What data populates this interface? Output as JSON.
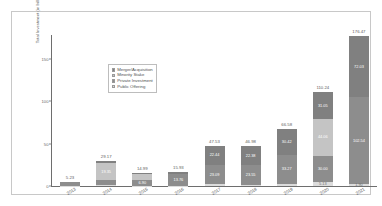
{
  "chart_data": {
    "type": "bar",
    "subtype": "stacked-bar",
    "title": "",
    "xlabel": "",
    "ylabel": "Total Investment (in billions of U.S. Dollars)",
    "categories": [
      "2013",
      "2014",
      "2015",
      "2016",
      "2017",
      "2018",
      "2019",
      "2020",
      "2021"
    ],
    "ylim": [
      0,
      180
    ],
    "yticks": [
      0,
      50,
      100,
      150
    ],
    "ytick_labels": [
      "0",
      "50",
      "100",
      "150"
    ],
    "grid": false,
    "legend_position": "upper left (inside axes)",
    "series": [
      {
        "name": "Merger/Acquisition",
        "color": "#808080",
        "values": [
          0.21,
          2.46,
          1.05,
          1.62,
          22.44,
          22.38,
          30.42,
          31.05,
          72.03
        ]
      },
      {
        "name": "Minority Stake",
        "color": "#c4c4c4",
        "values": [
          0.85,
          19.35,
          6.79,
          0.0,
          0.0,
          0.0,
          0.0,
          44.06,
          0.0
        ]
      },
      {
        "name": "Private Investment",
        "color": "#8d8d8d",
        "values": [
          3.86,
          6.42,
          6.9,
          13.76,
          23.09,
          23.55,
          33.27,
          30.0,
          102.54
        ]
      },
      {
        "name": "Public Offering",
        "color": "#dcdcdc",
        "values": [
          0.31,
          0.94,
          0.25,
          0.55,
          2.0,
          1.05,
          2.89,
          5.13,
          1.9
        ]
      }
    ],
    "stack_order_bottom_to_top": [
      "Public Offering",
      "Private Investment",
      "Minority Stake",
      "Merger/Acquisition"
    ],
    "totals": [
      5.23,
      29.17,
      14.99,
      15.93,
      47.53,
      46.98,
      66.58,
      110.24,
      176.47
    ],
    "total_labels": [
      "5.23",
      "29.17",
      "14.99",
      "15.93",
      "47.53",
      "46.98",
      "66.58",
      "110.24",
      "176.47"
    ],
    "bars": [
      {
        "category": "2013",
        "total_label": "5.23",
        "segments": [
          {
            "series": "Public Offering",
            "value": 0.31,
            "label": ""
          },
          {
            "series": "Private Investment",
            "value": 3.86,
            "label": ""
          },
          {
            "series": "Minority Stake",
            "value": 0.85,
            "label": ""
          },
          {
            "series": "Merger/Acquisition",
            "value": 0.21,
            "label": ""
          }
        ]
      },
      {
        "category": "2014",
        "total_label": "29.17",
        "segments": [
          {
            "series": "Public Offering",
            "value": 0.94,
            "label": ""
          },
          {
            "series": "Private Investment",
            "value": 6.42,
            "label": ""
          },
          {
            "series": "Minority Stake",
            "value": 19.35,
            "label": "19.35"
          },
          {
            "series": "Merger/Acquisition",
            "value": 2.46,
            "label": ""
          }
        ]
      },
      {
        "category": "2015",
        "total_label": "14.99",
        "segments": [
          {
            "series": "Public Offering",
            "value": 0.25,
            "label": ""
          },
          {
            "series": "Private Investment",
            "value": 6.9,
            "label": "6.90"
          },
          {
            "series": "Minority Stake",
            "value": 6.79,
            "label": ""
          },
          {
            "series": "Merger/Acquisition",
            "value": 1.05,
            "label": ""
          }
        ]
      },
      {
        "category": "2016",
        "total_label": "15.93",
        "segments": [
          {
            "series": "Public Offering",
            "value": 0.55,
            "label": ""
          },
          {
            "series": "Private Investment",
            "value": 13.76,
            "label": "13.76"
          },
          {
            "series": "Minority Stake",
            "value": 0.0,
            "label": ""
          },
          {
            "series": "Merger/Acquisition",
            "value": 1.62,
            "label": ""
          }
        ]
      },
      {
        "category": "2017",
        "total_label": "47.53",
        "segments": [
          {
            "series": "Public Offering",
            "value": 2.0,
            "label": ""
          },
          {
            "series": "Private Investment",
            "value": 23.09,
            "label": "23.09"
          },
          {
            "series": "Minority Stake",
            "value": 0.0,
            "label": ""
          },
          {
            "series": "Merger/Acquisition",
            "value": 22.44,
            "label": "22.44"
          }
        ]
      },
      {
        "category": "2018",
        "total_label": "46.98",
        "segments": [
          {
            "series": "Public Offering",
            "value": 1.05,
            "label": ""
          },
          {
            "series": "Private Investment",
            "value": 23.55,
            "label": "23.55"
          },
          {
            "series": "Minority Stake",
            "value": 0.0,
            "label": ""
          },
          {
            "series": "Merger/Acquisition",
            "value": 22.38,
            "label": "22.38"
          }
        ]
      },
      {
        "category": "2019",
        "total_label": "66.58",
        "segments": [
          {
            "series": "Public Offering",
            "value": 2.89,
            "label": ""
          },
          {
            "series": "Private Investment",
            "value": 33.27,
            "label": "33.27"
          },
          {
            "series": "Minority Stake",
            "value": 0.0,
            "label": ""
          },
          {
            "series": "Merger/Acquisition",
            "value": 30.42,
            "label": "30.42"
          }
        ]
      },
      {
        "category": "2020",
        "total_label": "110.24",
        "segments": [
          {
            "series": "Public Offering",
            "value": 5.13,
            "label": "5.13"
          },
          {
            "series": "Private Investment",
            "value": 30.0,
            "label": "30.00"
          },
          {
            "series": "Minority Stake",
            "value": 44.06,
            "label": "44.06"
          },
          {
            "series": "Merger/Acquisition",
            "value": 31.05,
            "label": "31.05"
          }
        ]
      },
      {
        "category": "2021",
        "total_label": "176.47",
        "segments": [
          {
            "series": "Public Offering",
            "value": 1.9,
            "label": "1.90"
          },
          {
            "series": "Private Investment",
            "value": 102.54,
            "label": "102.54"
          },
          {
            "series": "Minority Stake",
            "value": 0.0,
            "label": ""
          },
          {
            "series": "Merger/Acquisition",
            "value": 72.03,
            "label": "72.03"
          }
        ]
      }
    ]
  },
  "legend": {
    "items": [
      {
        "label": "Merger/Acquisition",
        "color": "#808080"
      },
      {
        "label": "Minority Stake",
        "color": "#c4c4c4"
      },
      {
        "label": "Private Investment",
        "color": "#8d8d8d"
      },
      {
        "label": "Public Offering",
        "color": "#dcdcdc"
      }
    ]
  }
}
